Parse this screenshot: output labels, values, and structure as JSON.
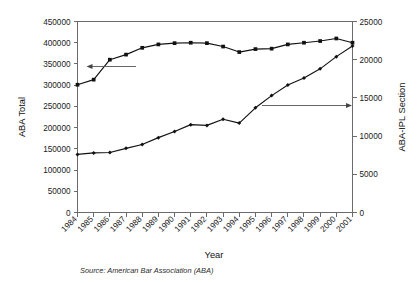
{
  "chart_data": {
    "type": "line",
    "title": "",
    "xlabel": "Year",
    "categories": [
      "1984",
      "1985",
      "1986",
      "1987",
      "1988",
      "1989",
      "1990",
      "1991",
      "1992",
      "1993",
      "1994",
      "1995",
      "1996",
      "1997",
      "1998",
      "1999",
      "2000",
      "2001"
    ],
    "grid": false,
    "legend": "none",
    "annotations": [
      {
        "name": "left-arrow-to-aba-total",
        "direction": "left",
        "points_to": "ABA Total series"
      },
      {
        "name": "right-arrow-to-ipl-section",
        "direction": "right",
        "points_to": "ABA-IPL Section series"
      }
    ],
    "axes": {
      "left": {
        "label": "ABA Total",
        "min": 0,
        "max": 450000,
        "step": 50000,
        "ticks": [
          "0",
          "50000",
          "100000",
          "150000",
          "200000",
          "250000",
          "300000",
          "350000",
          "400000",
          "450000"
        ]
      },
      "right": {
        "label": "ABA-IPL Section",
        "min": 0,
        "max": 25000,
        "step": 5000,
        "ticks": [
          "0",
          "5000",
          "10000",
          "15000",
          "20000",
          "25000"
        ]
      }
    },
    "series": [
      {
        "name": "ABA Total",
        "axis": "left",
        "marker": "square",
        "values": [
          301000,
          313000,
          360000,
          372000,
          388000,
          396000,
          399000,
          400000,
          399000,
          391000,
          378000,
          385000,
          386000,
          396000,
          400000,
          404000,
          410000,
          400000
        ]
      },
      {
        "name": "ABA-IPL Section",
        "axis": "right",
        "marker": "diamond",
        "values": [
          7600,
          7800,
          7850,
          8400,
          8900,
          9800,
          10600,
          11500,
          11400,
          12200,
          11700,
          13700,
          15300,
          16700,
          17600,
          18800,
          20400,
          21800
        ]
      }
    ]
  },
  "footnote": {
    "source": "Source: American Bar Association (ABA)"
  }
}
